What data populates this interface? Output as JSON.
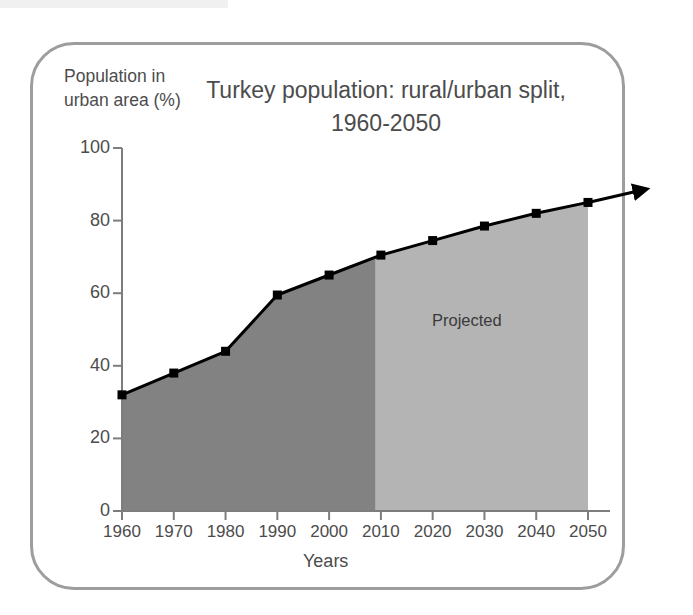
{
  "figure": {
    "border_color": "#9d9d9d",
    "background": "#ffffff"
  },
  "chart_data": {
    "type": "area",
    "title_line1": "Turkey population: rural/urban split,",
    "title_line2": "1960-2050",
    "xlabel": "Years",
    "ylabel": "Population in urban area (%)",
    "ylabel_line1": "Population in",
    "ylabel_line2": "urban area (%)",
    "xlim": [
      1960,
      2050
    ],
    "ylim": [
      0,
      100
    ],
    "grid": false,
    "legend": "none",
    "x": [
      1960,
      1970,
      1980,
      1990,
      2000,
      2010,
      2020,
      2030,
      2040,
      2050
    ],
    "values": [
      32,
      38,
      44,
      59.5,
      65,
      70.5,
      74.5,
      78.5,
      82,
      85
    ],
    "series": [
      {
        "name": "Urban population share (%)",
        "values": [
          32,
          38,
          44,
          59.5,
          65,
          70.5,
          74.5,
          78.5,
          82,
          85
        ],
        "line_color": "#000000",
        "marker": "square",
        "marker_color": "#000000"
      }
    ],
    "categories": [
      "1960",
      "1970",
      "1980",
      "1990",
      "2000",
      "2010",
      "2020",
      "2030",
      "2040",
      "2050"
    ],
    "xticks": [
      1960,
      1970,
      1980,
      1990,
      2000,
      2010,
      2020,
      2030,
      2040,
      2050
    ],
    "xticklabels": [
      "1960",
      "1970",
      "1980",
      "1990",
      "2000",
      "2010",
      "2020",
      "2030",
      "2040",
      "2050"
    ],
    "yticks": [
      0,
      20,
      40,
      60,
      80,
      100
    ],
    "yticklabels": [
      "0",
      "20",
      "40",
      "60",
      "80",
      "100"
    ],
    "annotations": [
      {
        "text": "Projected",
        "x": 2028,
        "y": 46,
        "region_start": 2009,
        "region_end": 2050
      }
    ],
    "regions": [
      {
        "name": "historical",
        "x_start": 1960,
        "x_end": 2009,
        "fill_color": "#828282"
      },
      {
        "name": "projected",
        "x_start": 2009,
        "x_end": 2050,
        "fill_color": "#b4b4b4"
      }
    ],
    "arrow": {
      "name": "trend-arrow",
      "from_x": 2050,
      "to_x": 2060,
      "color": "#000000"
    }
  }
}
